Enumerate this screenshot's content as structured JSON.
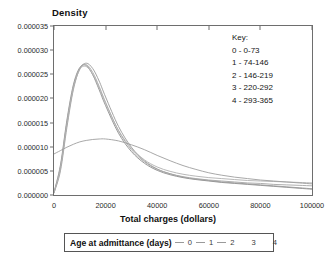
{
  "chart_data": {
    "type": "line",
    "title": "",
    "xlabel": "Total charges (dollars)",
    "ylabel": "Density",
    "xlim": [
      0,
      100000
    ],
    "ylim": [
      0,
      3.5e-05
    ],
    "grid": false,
    "legend_position": "below-axis",
    "xticks": [
      "0",
      "20000",
      "40000",
      "60000",
      "80000",
      "100000"
    ],
    "xtick_values": [
      0,
      20000,
      40000,
      60000,
      80000,
      100000
    ],
    "yticks": [
      "0.000000",
      "0.000005",
      "0.000010",
      "0.000015",
      "0.000020",
      "0.000025",
      "0.000030",
      "0.000035"
    ],
    "ytick_values": [
      0,
      5e-06,
      1e-05,
      1.5e-05,
      2e-05,
      2.5e-05,
      3e-05,
      3.5e-05
    ],
    "x": [
      0,
      2500,
      5000,
      7500,
      10000,
      12500,
      15000,
      17500,
      20000,
      25000,
      30000,
      35000,
      40000,
      45000,
      50000,
      55000,
      60000,
      65000,
      70000,
      75000,
      80000,
      85000,
      90000,
      95000,
      100000
    ],
    "series": [
      {
        "name": "0",
        "label": "0 - 0-73",
        "color": "#8c8c8c",
        "values": [
          6e-07,
          6.2e-06,
          1.55e-05,
          2.28e-05,
          2.64e-05,
          2.68e-05,
          2.49e-05,
          2.18e-05,
          1.85e-05,
          1.28e-05,
          9e-06,
          6.6e-06,
          5.1e-06,
          4.2e-06,
          3.6e-06,
          3.2e-06,
          2.9e-06,
          2.6e-06,
          2.4e-06,
          2.2e-06,
          2e-06,
          1.8e-06,
          1.6e-06,
          1.4e-06,
          1.2e-06
        ]
      },
      {
        "name": "1",
        "label": "1 - 74-146",
        "color": "#9a9a9a",
        "values": [
          4e-07,
          5e-06,
          1.4e-05,
          2.18e-05,
          2.61e-05,
          2.73e-05,
          2.62e-05,
          2.36e-05,
          2.03e-05,
          1.42e-05,
          9.9e-06,
          7.1e-06,
          5.4e-06,
          4.4e-06,
          3.7e-06,
          3.3e-06,
          3e-06,
          2.7e-06,
          2.5e-06,
          2.3e-06,
          2.1e-06,
          1.9e-06,
          1.7e-06,
          1.5e-06,
          1.3e-06
        ]
      },
      {
        "name": "2",
        "label": "2 - 146-219",
        "color": "#a5a5a5",
        "values": [
          5e-07,
          5.8e-06,
          1.5e-05,
          2.24e-05,
          2.62e-05,
          2.7e-05,
          2.54e-05,
          2.25e-05,
          1.92e-05,
          1.33e-05,
          9.4e-06,
          6.9e-06,
          5.3e-06,
          4.4e-06,
          3.8e-06,
          3.4e-06,
          3.1e-06,
          2.9e-06,
          2.7e-06,
          2.5e-06,
          2.4e-06,
          2.2e-06,
          2.1e-06,
          2e-06,
          1.9e-06
        ]
      },
      {
        "name": "3",
        "label": "3 - 220-292",
        "color": "#b0b0b0",
        "values": [
          5e-07,
          5.5e-06,
          1.46e-05,
          2.21e-05,
          2.6e-05,
          2.66e-05,
          2.5e-05,
          2.22e-05,
          1.9e-05,
          1.34e-05,
          9.7e-06,
          7.3e-06,
          5.8e-06,
          4.9e-06,
          4.3e-06,
          3.9e-06,
          3.6e-06,
          3.4e-06,
          3.2e-06,
          3e-06,
          2.9e-06,
          2.8e-06,
          2.7e-06,
          2.6e-06,
          2.5e-06
        ]
      },
      {
        "name": "4",
        "label": "4 - 293-365",
        "color": "#9e9e9e",
        "values": [
          8.5e-06,
          9.2e-06,
          9.9e-06,
          1.05e-05,
          1.1e-05,
          1.13e-05,
          1.15e-05,
          1.16e-05,
          1.16e-05,
          1.12e-05,
          1.04e-05,
          9.4e-06,
          8.2e-06,
          7.1e-06,
          6.1e-06,
          5.3e-06,
          4.6e-06,
          4.1e-06,
          3.7e-06,
          3.4e-06,
          3.1e-06,
          2.9e-06,
          2.7e-06,
          2.5e-06,
          2.3e-06
        ]
      }
    ]
  },
  "key_panel": {
    "heading": "Key:",
    "entries": [
      "0 - 0-73",
      "1 - 74-146",
      "2 - 146-219",
      "3 - 220-292",
      "4 - 293-365"
    ]
  },
  "legend_strip": {
    "title": "Age at admittance (days)",
    "items": [
      {
        "label": "0",
        "has_line": true
      },
      {
        "label": "1",
        "has_line": true
      },
      {
        "label": "2",
        "has_line": true
      },
      {
        "label": "3",
        "has_line": false
      },
      {
        "label": "4",
        "has_line": false
      }
    ]
  }
}
